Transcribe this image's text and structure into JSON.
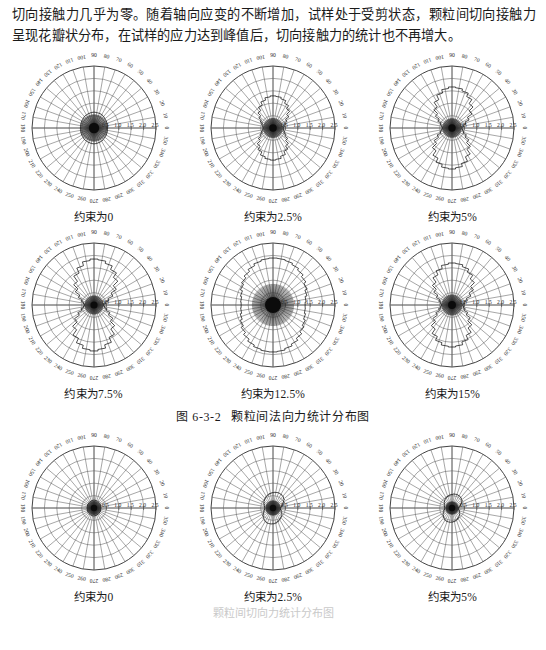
{
  "prose": {
    "paragraph": "切向接触力几乎为零。随着轴向应变的不断增加，试样处于受剪状态，颗粒间切向接触力呈现花瓣状分布，在试样的应力达到峰值后，切向接触力的统计也不再增大。"
  },
  "figure_caption": {
    "number": "图 6-3-2",
    "title": "颗粒间法向力统计分布图"
  },
  "bottom_partial_caption": "颗粒间切向力统计分布图",
  "polar_axes": {
    "angle_ticks": [
      0,
      10,
      20,
      30,
      40,
      50,
      60,
      70,
      80,
      90,
      100,
      110,
      120,
      130,
      140,
      150,
      160,
      170,
      180,
      190,
      200,
      210,
      220,
      230,
      240,
      250,
      260,
      270,
      280,
      290,
      300,
      310,
      320,
      330,
      340,
      350
    ],
    "angle_unit": "degree",
    "radial_ticks": [
      "0.5",
      "1.0",
      "1.5",
      "2.0",
      "2.5"
    ],
    "radial_max": 2.5,
    "radial_min": 0,
    "grid": "on"
  },
  "chart_data": [
    {
      "id": "normal-0",
      "type": "line",
      "plot_style": "polar-rose",
      "title": "约束为0",
      "caption": "约束为0",
      "xlabel": "角度 (°)",
      "ylabel": "法向接触力",
      "ylim": [
        0,
        2.5
      ],
      "categories": [
        0,
        10,
        20,
        30,
        40,
        50,
        60,
        70,
        80,
        90,
        100,
        110,
        120,
        130,
        140,
        150,
        160,
        170,
        180,
        190,
        200,
        210,
        220,
        230,
        240,
        250,
        260,
        270,
        280,
        290,
        300,
        310,
        320,
        330,
        340,
        350
      ],
      "values": [
        0.55,
        0.55,
        0.56,
        0.57,
        0.58,
        0.6,
        0.62,
        0.63,
        0.63,
        0.64,
        0.63,
        0.62,
        0.61,
        0.6,
        0.58,
        0.57,
        0.56,
        0.55,
        0.55,
        0.55,
        0.56,
        0.57,
        0.58,
        0.6,
        0.61,
        0.62,
        0.63,
        0.64,
        0.63,
        0.62,
        0.61,
        0.59,
        0.58,
        0.57,
        0.56,
        0.55
      ]
    },
    {
      "id": "normal-2p5",
      "type": "line",
      "plot_style": "polar-rose",
      "title": "约束为2.5%",
      "caption": "约束为2.5%",
      "xlabel": "角度 (°)",
      "ylabel": "法向接触力",
      "ylim": [
        0,
        2.5
      ],
      "categories": [
        0,
        10,
        20,
        30,
        40,
        50,
        60,
        70,
        80,
        90,
        100,
        110,
        120,
        130,
        140,
        150,
        160,
        170,
        180,
        190,
        200,
        210,
        220,
        230,
        240,
        250,
        260,
        270,
        280,
        290,
        300,
        310,
        320,
        330,
        340,
        350
      ],
      "values": [
        0.42,
        0.45,
        0.52,
        0.62,
        0.78,
        0.95,
        1.1,
        1.22,
        1.28,
        1.3,
        1.26,
        1.16,
        1.02,
        0.86,
        0.7,
        0.57,
        0.47,
        0.42,
        0.4,
        0.42,
        0.48,
        0.58,
        0.72,
        0.9,
        1.06,
        1.2,
        1.27,
        1.3,
        1.27,
        1.18,
        1.04,
        0.88,
        0.72,
        0.58,
        0.48,
        0.43
      ]
    },
    {
      "id": "normal-5",
      "type": "line",
      "plot_style": "polar-rose",
      "title": "约束为5%",
      "caption": "约束为5%",
      "xlabel": "角度 (°)",
      "ylabel": "法向接触力",
      "ylim": [
        0,
        2.5
      ],
      "categories": [
        0,
        10,
        20,
        30,
        40,
        50,
        60,
        70,
        80,
        90,
        100,
        110,
        120,
        130,
        140,
        150,
        160,
        170,
        180,
        190,
        200,
        210,
        220,
        230,
        240,
        250,
        260,
        270,
        280,
        290,
        300,
        310,
        320,
        330,
        340,
        350
      ],
      "values": [
        0.4,
        0.46,
        0.58,
        0.76,
        0.98,
        1.2,
        1.4,
        1.55,
        1.63,
        1.66,
        1.6,
        1.46,
        1.26,
        1.04,
        0.82,
        0.63,
        0.49,
        0.42,
        0.39,
        0.42,
        0.5,
        0.66,
        0.88,
        1.12,
        1.34,
        1.52,
        1.63,
        1.66,
        1.61,
        1.48,
        1.28,
        1.05,
        0.83,
        0.64,
        0.5,
        0.43
      ]
    },
    {
      "id": "normal-7p5",
      "type": "line",
      "plot_style": "polar-rose",
      "title": "约束为7.5%",
      "caption": "约束为7.5%",
      "xlabel": "角度 (°)",
      "ylabel": "法向接触力",
      "ylim": [
        0,
        2.5
      ],
      "categories": [
        0,
        10,
        20,
        30,
        40,
        50,
        60,
        70,
        80,
        90,
        100,
        110,
        120,
        130,
        140,
        150,
        160,
        170,
        180,
        190,
        200,
        210,
        220,
        230,
        240,
        250,
        260,
        270,
        280,
        290,
        300,
        310,
        320,
        330,
        340,
        350
      ],
      "values": [
        0.38,
        0.46,
        0.62,
        0.84,
        1.1,
        1.36,
        1.58,
        1.74,
        1.83,
        1.86,
        1.8,
        1.64,
        1.42,
        1.16,
        0.92,
        0.7,
        0.53,
        0.43,
        0.38,
        0.43,
        0.54,
        0.72,
        0.96,
        1.22,
        1.48,
        1.68,
        1.81,
        1.86,
        1.8,
        1.66,
        1.44,
        1.18,
        0.93,
        0.71,
        0.54,
        0.43
      ]
    },
    {
      "id": "normal-12p5",
      "type": "line",
      "plot_style": "polar-rose",
      "title": "约束为12.5%",
      "caption": "约束为12.5%",
      "xlabel": "角度 (°)",
      "ylabel": "法向接触力",
      "ylim": [
        0,
        2.5
      ],
      "categories": [
        0,
        10,
        20,
        30,
        40,
        50,
        60,
        70,
        80,
        90,
        100,
        110,
        120,
        130,
        140,
        150,
        160,
        170,
        180,
        190,
        200,
        210,
        220,
        230,
        240,
        250,
        260,
        270,
        280,
        290,
        300,
        310,
        320,
        330,
        340,
        350
      ],
      "values": [
        1.3,
        1.34,
        1.42,
        1.52,
        1.62,
        1.72,
        1.8,
        1.86,
        1.89,
        1.9,
        1.88,
        1.83,
        1.75,
        1.65,
        1.55,
        1.45,
        1.36,
        1.31,
        1.29,
        1.31,
        1.37,
        1.46,
        1.57,
        1.68,
        1.78,
        1.85,
        1.89,
        1.9,
        1.88,
        1.82,
        1.74,
        1.64,
        1.53,
        1.44,
        1.36,
        1.31
      ]
    },
    {
      "id": "normal-15",
      "type": "line",
      "plot_style": "polar-rose",
      "title": "约束为15%",
      "caption": "约束为15%",
      "xlabel": "角度 (°)",
      "ylabel": "法向接触力",
      "ylim": [
        0,
        2.5
      ],
      "categories": [
        0,
        10,
        20,
        30,
        40,
        50,
        60,
        70,
        80,
        90,
        100,
        110,
        120,
        130,
        140,
        150,
        160,
        170,
        180,
        190,
        200,
        210,
        220,
        230,
        240,
        250,
        260,
        270,
        280,
        290,
        300,
        310,
        320,
        330,
        340,
        350
      ],
      "values": [
        0.44,
        0.5,
        0.64,
        0.84,
        1.06,
        1.28,
        1.46,
        1.6,
        1.68,
        1.7,
        1.65,
        1.52,
        1.34,
        1.12,
        0.9,
        0.7,
        0.55,
        0.46,
        0.42,
        0.46,
        0.56,
        0.72,
        0.94,
        1.18,
        1.4,
        1.57,
        1.67,
        1.7,
        1.66,
        1.54,
        1.35,
        1.13,
        0.9,
        0.7,
        0.55,
        0.47
      ]
    },
    {
      "id": "tangential-0",
      "type": "line",
      "plot_style": "polar-rose",
      "title": "约束为0",
      "caption": "约束为0",
      "xlabel": "角度 (°)",
      "ylabel": "切向接触力",
      "ylim": [
        0,
        2.5
      ],
      "categories": [
        0,
        10,
        20,
        30,
        40,
        50,
        60,
        70,
        80,
        90,
        100,
        110,
        120,
        130,
        140,
        150,
        160,
        170,
        180,
        190,
        200,
        210,
        220,
        230,
        240,
        250,
        260,
        270,
        280,
        290,
        300,
        310,
        320,
        330,
        340,
        350
      ],
      "values": [
        0.28,
        0.28,
        0.29,
        0.29,
        0.3,
        0.3,
        0.31,
        0.31,
        0.31,
        0.32,
        0.31,
        0.31,
        0.3,
        0.3,
        0.29,
        0.29,
        0.28,
        0.28,
        0.28,
        0.28,
        0.29,
        0.29,
        0.3,
        0.3,
        0.31,
        0.31,
        0.32,
        0.32,
        0.31,
        0.31,
        0.3,
        0.3,
        0.29,
        0.29,
        0.28,
        0.28
      ]
    },
    {
      "id": "tangential-2p5",
      "type": "line",
      "plot_style": "polar-rose",
      "title": "约束为2.5%",
      "caption": "约束为2.5%",
      "xlabel": "角度 (°)",
      "ylabel": "切向接触力",
      "ylim": [
        0,
        2.5
      ],
      "categories": [
        0,
        10,
        20,
        30,
        40,
        50,
        60,
        70,
        80,
        90,
        100,
        110,
        120,
        130,
        140,
        150,
        160,
        170,
        180,
        190,
        200,
        210,
        220,
        230,
        240,
        250,
        260,
        270,
        280,
        290,
        300,
        310,
        320,
        330,
        340,
        350
      ],
      "values": [
        0.3,
        0.34,
        0.42,
        0.5,
        0.57,
        0.62,
        0.64,
        0.65,
        0.64,
        0.62,
        0.6,
        0.57,
        0.54,
        0.5,
        0.46,
        0.42,
        0.38,
        0.35,
        0.34,
        0.35,
        0.39,
        0.45,
        0.52,
        0.58,
        0.62,
        0.65,
        0.65,
        0.64,
        0.62,
        0.58,
        0.54,
        0.5,
        0.45,
        0.4,
        0.35,
        0.31
      ]
    },
    {
      "id": "tangential-5",
      "type": "line",
      "plot_style": "polar-rose",
      "title": "约束为5%",
      "caption": "约束为5%",
      "xlabel": "角度 (°)",
      "ylabel": "切向接触力",
      "ylim": [
        0,
        2.5
      ],
      "categories": [
        0,
        10,
        20,
        30,
        40,
        50,
        60,
        70,
        80,
        90,
        100,
        110,
        120,
        130,
        140,
        150,
        160,
        170,
        180,
        190,
        200,
        210,
        220,
        230,
        240,
        250,
        260,
        270,
        280,
        290,
        300,
        310,
        320,
        330,
        340,
        350
      ],
      "values": [
        0.26,
        0.3,
        0.37,
        0.45,
        0.51,
        0.55,
        0.57,
        0.58,
        0.57,
        0.55,
        0.53,
        0.5,
        0.47,
        0.44,
        0.4,
        0.36,
        0.33,
        0.31,
        0.3,
        0.31,
        0.35,
        0.4,
        0.46,
        0.52,
        0.56,
        0.58,
        0.58,
        0.57,
        0.55,
        0.52,
        0.48,
        0.44,
        0.4,
        0.35,
        0.31,
        0.27
      ]
    }
  ]
}
